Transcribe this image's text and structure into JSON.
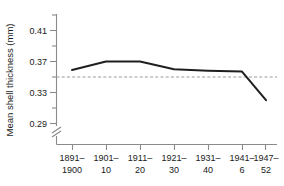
{
  "chart_data": {
    "type": "line",
    "title": "",
    "xlabel": "",
    "ylabel": "Mean shell thickness (mm)",
    "categories": [
      "1891–\n1900",
      "1901–\n10",
      "1911–\n20",
      "1921–\n30",
      "1931–\n40",
      "1941–\n6",
      "1947–\n52"
    ],
    "category_lines": [
      {
        "top": "1891–",
        "bottom": "1900"
      },
      {
        "top": "1901–",
        "bottom": "10"
      },
      {
        "top": "1911–",
        "bottom": "20"
      },
      {
        "top": "1921–",
        "bottom": "30"
      },
      {
        "top": "1931–",
        "bottom": "40"
      },
      {
        "top": "1941–",
        "bottom": "6"
      },
      {
        "top": "1947–",
        "bottom": "52"
      }
    ],
    "values": [
      0.359,
      0.37,
      0.37,
      0.36,
      0.358,
      0.357,
      0.32
    ],
    "ylim": [
      0.27,
      0.43
    ],
    "yticks": [
      0.29,
      0.33,
      0.37,
      0.41
    ],
    "ytick_labels": [
      "0.29",
      "0.33",
      "0.37",
      "0.41"
    ],
    "yticks_minor": [
      0.31,
      0.35,
      0.39,
      0.43
    ],
    "grid": false,
    "legend": "none",
    "axis_break": true,
    "reference_line": {
      "value": 0.35,
      "style": "dashed",
      "color": "#9a9a9a"
    },
    "line_color": "#1f1f1f"
  }
}
